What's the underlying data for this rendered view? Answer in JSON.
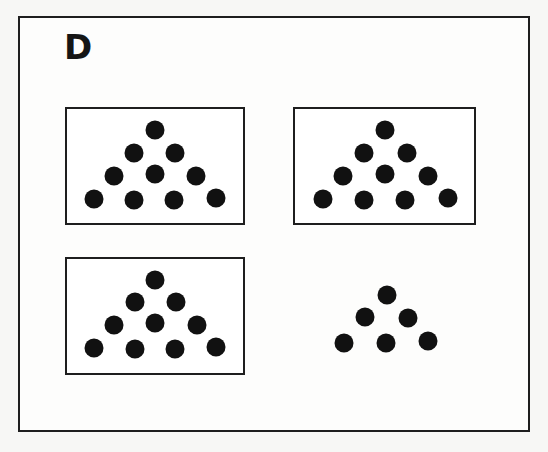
{
  "figure": {
    "label": "D",
    "colors": {
      "frame": "#1e1e1e",
      "dot": "#111111",
      "background": "#fdfdfc"
    },
    "panels": [
      {
        "id": "top-left",
        "boxed": true,
        "rows": [
          1,
          2,
          3,
          4
        ],
        "dot_count": 10
      },
      {
        "id": "top-right",
        "boxed": true,
        "rows": [
          1,
          2,
          3,
          4
        ],
        "dot_count": 10
      },
      {
        "id": "bottom-left",
        "boxed": true,
        "rows": [
          1,
          2,
          3,
          4
        ],
        "dot_count": 10
      },
      {
        "id": "bottom-right",
        "boxed": false,
        "rows": [
          1,
          2,
          3
        ],
        "dot_count": 6
      }
    ]
  }
}
